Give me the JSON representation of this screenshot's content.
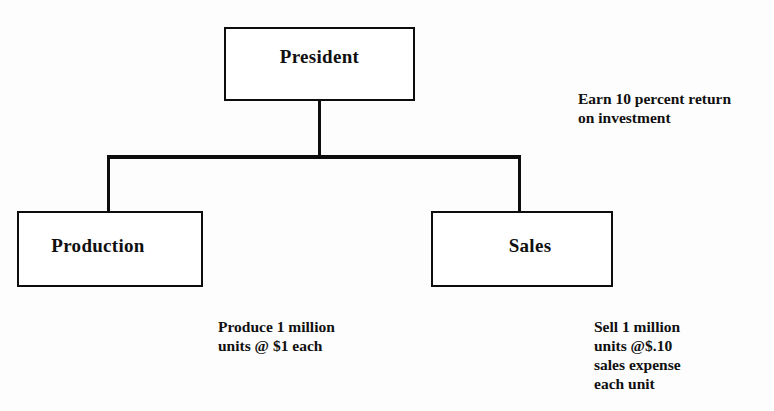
{
  "diagram": {
    "type": "organizational-chart",
    "nodes": {
      "president": {
        "label": "President"
      },
      "production": {
        "label": "Production"
      },
      "sales": {
        "label": "Sales"
      }
    },
    "annotations": {
      "roi": "Earn 10 percent return\non investment",
      "production": "Produce 1 million\nunits @ $1 each",
      "sales": "Sell 1 million\nunits @$.10\nsales expense\neach unit"
    },
    "colors": {
      "ink": "#0d0d0d",
      "paper": "#fdfdfd"
    }
  }
}
